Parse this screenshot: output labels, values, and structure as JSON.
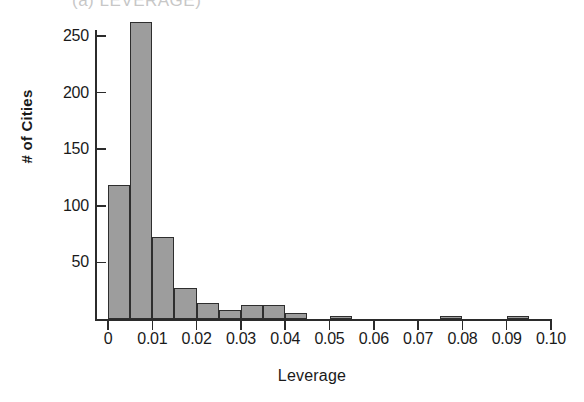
{
  "figure": {
    "cut_off_title": "(a) LEVERAGE)",
    "background": "#ffffff",
    "bar_fill": "#9d9d9d",
    "bar_edge": "#2e2e2e",
    "axis_color": "#2b2b2b"
  },
  "chart_data": {
    "type": "bar",
    "title": "",
    "xlabel": "Leverage",
    "ylabel": "# of Cities",
    "xlim": [
      0,
      0.1
    ],
    "ylim": [
      0,
      268
    ],
    "grid": false,
    "legend": null,
    "bin_width": 0.005,
    "xticks": [
      0,
      0.01,
      0.02,
      0.03,
      0.04,
      0.05,
      0.06,
      0.07,
      0.08,
      0.09,
      0.1
    ],
    "xtick_labels": [
      "0",
      "0.01",
      "0.02",
      "0.03",
      "0.04",
      "0.05",
      "0.06",
      "0.07",
      "0.08",
      "0.09",
      "0.10"
    ],
    "yticks": [
      50,
      100,
      150,
      200,
      250
    ],
    "ytick_labels": [
      "50",
      "100",
      "150",
      "200",
      "250"
    ],
    "bins": [
      {
        "x0": 0.0,
        "x1": 0.005,
        "value": 118
      },
      {
        "x0": 0.005,
        "x1": 0.01,
        "value": 262
      },
      {
        "x0": 0.01,
        "x1": 0.015,
        "value": 72
      },
      {
        "x0": 0.015,
        "x1": 0.02,
        "value": 27
      },
      {
        "x0": 0.02,
        "x1": 0.025,
        "value": 14
      },
      {
        "x0": 0.025,
        "x1": 0.03,
        "value": 8
      },
      {
        "x0": 0.03,
        "x1": 0.035,
        "value": 12
      },
      {
        "x0": 0.035,
        "x1": 0.04,
        "value": 12
      },
      {
        "x0": 0.04,
        "x1": 0.045,
        "value": 5
      },
      {
        "x0": 0.045,
        "x1": 0.05,
        "value": 0
      },
      {
        "x0": 0.05,
        "x1": 0.055,
        "value": 3
      },
      {
        "x0": 0.055,
        "x1": 0.06,
        "value": 0
      },
      {
        "x0": 0.06,
        "x1": 0.065,
        "value": 0
      },
      {
        "x0": 0.065,
        "x1": 0.07,
        "value": 0
      },
      {
        "x0": 0.07,
        "x1": 0.075,
        "value": 0
      },
      {
        "x0": 0.075,
        "x1": 0.08,
        "value": 3
      },
      {
        "x0": 0.08,
        "x1": 0.085,
        "value": 0
      },
      {
        "x0": 0.085,
        "x1": 0.09,
        "value": 0
      },
      {
        "x0": 0.09,
        "x1": 0.095,
        "value": 3
      },
      {
        "x0": 0.095,
        "x1": 0.1,
        "value": 0
      }
    ]
  }
}
